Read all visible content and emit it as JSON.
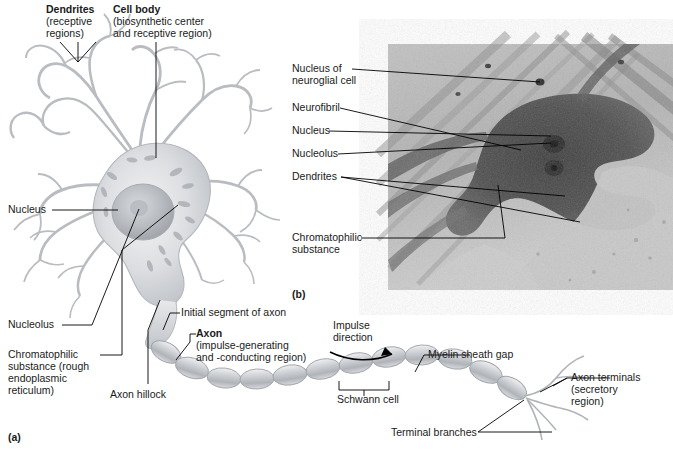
{
  "figure": {
    "title_a_panel": "(a)",
    "title_b_panel": "(b)"
  },
  "panels": [
    {
      "id": "a",
      "label": "(a)",
      "x": 8,
      "y": 432,
      "caption_type": "diagram"
    },
    {
      "id": "b",
      "label": "(b)",
      "x": 292,
      "y": 288,
      "caption_type": "micrograph"
    }
  ],
  "diagram": {
    "top_labels": [
      {
        "name": "dendrites",
        "bold_text": "Dendrites",
        "detail_lines": [
          "(receptive",
          "regions)"
        ],
        "x": 46,
        "y": 5
      },
      {
        "name": "cell-body",
        "bold_text": "Cell body",
        "detail_lines": [
          "(biosynthetic center",
          "and receptive region)"
        ],
        "x": 113,
        "y": 5
      }
    ],
    "left_labels": [
      {
        "name": "nucleus",
        "text": "Nucleus",
        "x": 8,
        "y": 205
      },
      {
        "name": "nucleolus",
        "text": "Nucleolus",
        "x": 8,
        "y": 320
      },
      {
        "name": "chromatophilic-substance",
        "lines": [
          "Chromatophilic",
          "substance (rough",
          "endoplasmic",
          "reticulum)"
        ],
        "x": 8,
        "y": 350
      }
    ],
    "axon_labels": [
      {
        "name": "initial-segment-of-axon",
        "text": "Initial segment of axon",
        "x": 181,
        "y": 309
      },
      {
        "name": "axon",
        "bold_text": "Axon",
        "detail_lines": [
          "(impulse-generating",
          "and -conducting region)"
        ],
        "x": 196,
        "y": 330
      },
      {
        "name": "axon-hillock",
        "text": "Axon hillock",
        "x": 110,
        "y": 390
      },
      {
        "name": "impulse-direction",
        "lines": [
          "Impulse",
          "direction"
        ],
        "x": 333,
        "y": 322
      },
      {
        "name": "schwann-cell",
        "text": "Schwann cell",
        "x": 337,
        "y": 394
      },
      {
        "name": "myelin-sheath-gap",
        "text": "Myelin sheath gap",
        "x": 428,
        "y": 350
      },
      {
        "name": "axon-terminals",
        "bold_text": "",
        "detail_lines": [
          "Axon terminals",
          "(secretory",
          "region)"
        ],
        "x": 571,
        "y": 373
      },
      {
        "name": "terminal-branches",
        "text": "Terminal branches",
        "x": 391,
        "y": 428
      }
    ]
  },
  "micrograph": {
    "frame": {
      "x": 388,
      "y": 44,
      "width": 285,
      "height": 246
    },
    "labels": [
      {
        "name": "nucleus-of-neuroglial-cell",
        "lines": [
          "Nucleus of",
          "neuroglial cell"
        ],
        "x": 292,
        "y": 64
      },
      {
        "name": "neurofibril",
        "lines": [
          "Neurofibril"
        ],
        "x": 292,
        "y": 103
      },
      {
        "name": "nucleus",
        "lines": [
          "Nucleus"
        ],
        "x": 292,
        "y": 126
      },
      {
        "name": "nucleolus",
        "lines": [
          "Nucleolus"
        ],
        "x": 292,
        "y": 149
      },
      {
        "name": "dendrites",
        "lines": [
          "Dendrites"
        ],
        "x": 292,
        "y": 172
      },
      {
        "name": "chromatophilic-substance",
        "lines": [
          "Chromatophilic",
          "substance"
        ],
        "x": 292,
        "y": 233
      }
    ]
  },
  "colors": {
    "ink": "#1a1a1a",
    "leader_line": "#000000",
    "cell_outline": "#b9bcc0",
    "cell_fill_light": "#e9eaec",
    "cell_fill_mid": "#c9ccd1",
    "nucleus": "#b0b4ba",
    "myelin_fill": "#c4c7cb",
    "micrograph_light": "#b8b8b8",
    "micrograph_dark": "#4a4a4a",
    "background": "#ffffff"
  }
}
